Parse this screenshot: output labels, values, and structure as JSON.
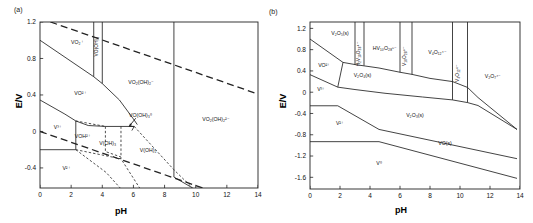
{
  "figure": {
    "panels": [
      {
        "tag": "(a)",
        "axes": {
          "xlabel": "pH",
          "ylabel": "E/V",
          "xticks": [
            "0",
            "2",
            "4",
            "6",
            "8",
            "10",
            "12",
            "14"
          ],
          "xtick_values": [
            0,
            2,
            4,
            6,
            8,
            10,
            12,
            14
          ],
          "yticks": [
            "1.2",
            "0.8",
            "0.4",
            "0",
            "-0.4"
          ],
          "ytick_values": [
            1.2,
            0.8,
            0.4,
            0,
            -0.4
          ],
          "xlim": [
            0,
            14
          ],
          "ylim": [
            -0.62,
            1.2
          ]
        },
        "species": [
          {
            "name": "VO2+",
            "label": "VO₂⁺",
            "x": 2.4,
            "y": 0.96,
            "rotate": 0
          },
          {
            "name": "VO-OH-3",
            "label": "VO(OH)₃",
            "x": 3.72,
            "y": 0.93,
            "rotate": -90
          },
          {
            "name": "VO2+-vanadyl",
            "label": "VO²⁺",
            "x": 2.6,
            "y": 0.4,
            "rotate": 0
          },
          {
            "name": "VO2-OH-2-minus",
            "label": "VO₂(OH)₂⁻",
            "x": 6.5,
            "y": 0.52,
            "rotate": 0
          },
          {
            "name": "VO-OH-3-neutral",
            "label": "VO(OH)₃⁰",
            "x": 6.45,
            "y": 0.155,
            "rotate": 0
          },
          {
            "name": "VO2-OH-2-2minus",
            "label": "VO₂(OH)₂²⁻",
            "x": 11.3,
            "y": 0.12,
            "rotate": 0
          },
          {
            "name": "V3+",
            "label": "V³⁺",
            "x": 1.15,
            "y": 0.025,
            "rotate": 0
          },
          {
            "name": "VOH2+",
            "label": "VOH²⁺",
            "x": 2.75,
            "y": -0.07,
            "rotate": 0
          },
          {
            "name": "V-OH-3",
            "label": "V(OH)₃",
            "x": 4.35,
            "y": -0.145,
            "rotate": 0
          },
          {
            "name": "V-OH-2",
            "label": "V(OH)₂",
            "x": 6.95,
            "y": -0.23,
            "rotate": 0
          },
          {
            "name": "V2+",
            "label": "V²⁺",
            "x": 1.7,
            "y": -0.42,
            "rotate": 0
          }
        ],
        "annotation": {
          "name": "arrow-to-vo-oh-3",
          "from_x": 6.15,
          "from_y": 0.145,
          "to_x": 5.72,
          "to_y": 0.055
        }
      },
      {
        "tag": "(b)",
        "axes": {
          "xlabel": "pH",
          "ylabel": "E/V",
          "xticks": [
            "0",
            "2",
            "4",
            "6",
            "8",
            "10",
            "12",
            "14"
          ],
          "xtick_values": [
            0,
            2,
            4,
            6,
            8,
            10,
            12,
            14
          ],
          "yticks": [
            "1.2",
            "0.8",
            "0.4",
            "0",
            "-0.4",
            "-0.8",
            "-1.2",
            "-1.6"
          ],
          "ytick_values": [
            1.2,
            0.8,
            0.4,
            0,
            -0.4,
            -0.8,
            -1.2,
            -1.6
          ],
          "xlim": [
            0,
            14
          ],
          "ylim": [
            -1.82,
            1.32
          ]
        },
        "species": [
          {
            "name": "V2O5-s",
            "label": "V₂O₅(s)",
            "x": 2.0,
            "y": 1.07,
            "rotate": 0
          },
          {
            "name": "H2V10O28-4minus",
            "label": "H₂V₁₀O₂₈⁴⁻",
            "x": 3.35,
            "y": 0.72,
            "rotate": -90
          },
          {
            "name": "HV10O28-5minus",
            "label": "HV₁₀O₂₈⁵⁻",
            "x": 5.0,
            "y": 0.8,
            "rotate": 0
          },
          {
            "name": "V10O28-6minus",
            "label": "V₁₀O₂₈⁶⁻",
            "x": 6.37,
            "y": 0.68,
            "rotate": -90
          },
          {
            "name": "V4O12-4minus",
            "label": "V₄O₁₂⁴⁻",
            "x": 8.5,
            "y": 0.72,
            "rotate": 0
          },
          {
            "name": "V4O12-4minus-vert",
            "label": "V₄O₁₂⁴⁻",
            "x": 9.95,
            "y": 0.36,
            "rotate": -90
          },
          {
            "name": "V2O7-4minus",
            "label": "V₂O₇⁴⁻",
            "x": 12.2,
            "y": 0.27,
            "rotate": 0
          },
          {
            "name": "VO2plus",
            "label": "VO²⁺",
            "x": 0.95,
            "y": 0.47,
            "rotate": 0
          },
          {
            "name": "V2O4-s",
            "label": "V₂O₄(s)",
            "x": 3.5,
            "y": 0.29,
            "rotate": 0
          },
          {
            "name": "V3plus",
            "label": "V³⁺",
            "x": 0.75,
            "y": 0.03,
            "rotate": 0
          },
          {
            "name": "V2plus",
            "label": "V²⁺",
            "x": 2.0,
            "y": -0.62,
            "rotate": 0
          },
          {
            "name": "V2O3-s",
            "label": "V₂O₃(s)",
            "x": 7.0,
            "y": -0.47,
            "rotate": 0
          },
          {
            "name": "VO-s",
            "label": "VO(s)",
            "x": 9.0,
            "y": -1.0,
            "rotate": 0
          },
          {
            "name": "V0",
            "label": "V⁰",
            "x": 4.6,
            "y": -1.36,
            "rotate": 0
          }
        ]
      }
    ]
  },
  "chart_data": [
    {
      "type": "line",
      "title": "(a) Pourbaix diagram of vanadium aqueous species",
      "xlabel": "pH",
      "ylabel": "E/V",
      "xlim": [
        0,
        14
      ],
      "ylim": [
        -0.62,
        1.2
      ],
      "grid": false,
      "legend": "none",
      "xticks": [
        0,
        2,
        4,
        6,
        8,
        10,
        12,
        14
      ],
      "yticks": [
        1.2,
        0.8,
        0.4,
        0,
        -0.4
      ],
      "solid_boundaries": [
        {
          "name": "VO2+/VO2+ boundary",
          "points": [
            [
              0,
              1.0
            ],
            [
              3.45,
              0.6
            ],
            [
              4.0,
              0.525
            ],
            [
              5.1,
              0.345
            ],
            [
              6.05,
              0.125
            ],
            [
              6.25,
              0.075
            ]
          ]
        },
        {
          "name": "V3+/VO2+ boundary",
          "points": [
            [
              0,
              0.345
            ],
            [
              1.6,
              0.19
            ],
            [
              2.3,
              0.115
            ],
            [
              3.1,
              0.065
            ],
            [
              4.2,
              0.055
            ],
            [
              5.2,
              0.055
            ],
            [
              6.05,
              0.055
            ]
          ]
        },
        {
          "name": "VO-OH-3 left vertical",
          "points": [
            [
              3.45,
              1.2
            ],
            [
              3.45,
              0.6
            ]
          ]
        },
        {
          "name": "VO-OH-3 right vertical",
          "points": [
            [
              4.0,
              1.2
            ],
            [
              4.0,
              0.525
            ]
          ]
        },
        {
          "name": "VO2-OH-2-2minus vertical",
          "points": [
            [
              8.6,
              1.2
            ],
            [
              8.6,
              -0.5
            ]
          ]
        },
        {
          "name": "VOH2+ vertical",
          "points": [
            [
              2.3,
              0.115
            ],
            [
              2.3,
              -0.2
            ]
          ]
        },
        {
          "name": "V2+ horizontal",
          "points": [
            [
              0,
              -0.2
            ],
            [
              2.3,
              -0.2
            ]
          ]
        },
        {
          "name": "VO-OH-3 apex triangle",
          "points": [
            [
              5.72,
              0.055
            ],
            [
              6.05,
              0.055
            ],
            [
              5.9,
              0.01
            ]
          ]
        },
        {
          "name": "lower convergence",
          "points": [
            [
              8.6,
              -0.5
            ],
            [
              9.8,
              -0.62
            ]
          ]
        }
      ],
      "dashed_boundaries": [
        {
          "name": "water oxidation line O2/H2O",
          "points": [
            [
              0,
              1.24
            ],
            [
              14,
              0.41
            ]
          ],
          "style": "long-dash"
        },
        {
          "name": "water reduction line H+/H2",
          "points": [
            [
              0,
              0.0
            ],
            [
              14,
              -0.83
            ]
          ],
          "style": "long-dash"
        },
        {
          "name": "V(OH)3 / V(OH)2 boundaries",
          "points": [
            [
              4.2,
              0.055
            ],
            [
              4.2,
              -0.22
            ],
            [
              5.2,
              -0.28
            ]
          ],
          "style": "short-dash"
        },
        {
          "name": "VOH2+/V(OH)3 boundary",
          "points": [
            [
              2.3,
              0.115
            ],
            [
              4.2,
              0.055
            ]
          ],
          "style": "short-dash"
        },
        {
          "name": "V(OH)3 region lower",
          "points": [
            [
              5.2,
              0.055
            ],
            [
              5.2,
              -0.3
            ]
          ],
          "style": "short-dash"
        },
        {
          "name": "VO(OH)3 descending",
          "points": [
            [
              6.05,
              0.055
            ],
            [
              8.6,
              -0.42
            ],
            [
              9.8,
              -0.62
            ]
          ],
          "style": "short-dash"
        },
        {
          "name": "V2+ boundary descending",
          "points": [
            [
              2.3,
              -0.2
            ],
            [
              5.2,
              -0.3
            ],
            [
              6.4,
              -0.62
            ]
          ],
          "style": "short-dash"
        },
        {
          "name": "V2+ inner boundary",
          "points": [
            [
              2.3,
              -0.2
            ],
            [
              4.25,
              -0.45
            ],
            [
              5.15,
              -0.62
            ]
          ],
          "style": "short-dash"
        }
      ],
      "regions": [
        "VO₂⁺",
        "VO(OH)₃",
        "VO²⁺",
        "VO₂(OH)₂⁻",
        "VO(OH)₃⁰",
        "VO₂(OH)₂²⁻",
        "V³⁺",
        "VOH²⁺",
        "V(OH)₃",
        "V(OH)₂",
        "V²⁺"
      ]
    },
    {
      "type": "line",
      "title": "(b) Pourbaix diagram of vanadium with polyoxovanadates",
      "xlabel": "pH",
      "ylabel": "E/V",
      "xlim": [
        0,
        14
      ],
      "ylim": [
        -1.82,
        1.32
      ],
      "grid": false,
      "legend": "none",
      "xticks": [
        0,
        2,
        4,
        6,
        8,
        10,
        12,
        14
      ],
      "yticks": [
        1.2,
        0.8,
        0.4,
        0,
        -0.4,
        -0.8,
        -1.2,
        -1.6
      ],
      "solid_boundaries": [
        {
          "name": "V2O5/VO2+ and V2O4 top boundary",
          "points": [
            [
              0,
              1.0
            ],
            [
              2.2,
              0.56
            ],
            [
              3.0,
              0.52
            ],
            [
              4.6,
              0.455
            ],
            [
              6.0,
              0.375
            ],
            [
              6.8,
              0.335
            ],
            [
              8.0,
              0.26
            ],
            [
              9.5,
              0.2
            ],
            [
              10.5,
              0.09
            ],
            [
              11.2,
              -0.1
            ],
            [
              13.8,
              -0.7
            ]
          ]
        },
        {
          "name": "VO2+/V3+ boundary",
          "points": [
            [
              0,
              0.33
            ],
            [
              1.85,
              0.095
            ]
          ]
        },
        {
          "name": "V2O4/V2O3 boundary",
          "points": [
            [
              1.85,
              0.095
            ],
            [
              3.0,
              0.05
            ],
            [
              5.0,
              -0.02
            ],
            [
              7.5,
              -0.09
            ],
            [
              9.5,
              -0.145
            ],
            [
              10.5,
              -0.195
            ],
            [
              11.2,
              -0.25
            ],
            [
              13.8,
              -0.7
            ]
          ]
        },
        {
          "name": "VO2+ lower vertical",
          "points": [
            [
              2.2,
              0.56
            ],
            [
              1.85,
              0.095
            ]
          ]
        },
        {
          "name": "V3+ / V2+ horizontal",
          "points": [
            [
              0,
              -0.255
            ],
            [
              1.85,
              -0.255
            ]
          ]
        },
        {
          "name": "V2+ / V2O3 boundary",
          "points": [
            [
              1.85,
              -0.255
            ],
            [
              4.6,
              -0.7
            ]
          ]
        },
        {
          "name": "V2O3/VO boundary",
          "points": [
            [
              4.6,
              -0.7
            ],
            [
              13.8,
              -1.25
            ]
          ]
        },
        {
          "name": "V2+ / V0 horizontal",
          "points": [
            [
              0,
              -0.93
            ],
            [
              4.6,
              -0.93
            ]
          ]
        },
        {
          "name": "VO / V0 boundary",
          "points": [
            [
              4.6,
              -0.93
            ],
            [
              13.8,
              -1.62
            ]
          ]
        },
        {
          "name": "H2V10O28 left vertical",
          "points": [
            [
              3.0,
              1.32
            ],
            [
              3.0,
              0.52
            ]
          ]
        },
        {
          "name": "H2V10O28 right vertical",
          "points": [
            [
              3.6,
              1.32
            ],
            [
              3.6,
              0.5
            ]
          ]
        },
        {
          "name": "V10O28 left vertical",
          "points": [
            [
              6.0,
              1.32
            ],
            [
              6.0,
              0.375
            ]
          ]
        },
        {
          "name": "V10O28 right vertical",
          "points": [
            [
              6.8,
              1.32
            ],
            [
              6.8,
              0.335
            ]
          ]
        },
        {
          "name": "V4O12 vertical left",
          "points": [
            [
              9.5,
              1.32
            ],
            [
              9.5,
              -0.145
            ]
          ]
        },
        {
          "name": "V4O12 vertical right",
          "points": [
            [
              10.5,
              1.32
            ],
            [
              10.5,
              -0.195
            ]
          ]
        }
      ],
      "regions": [
        "V₂O₅(s)",
        "H₂V₁₀O₂₈⁴⁻",
        "HV₁₀O₂₈⁵⁻",
        "V₁₀O₂₈⁶⁻",
        "V₄O₁₂⁴⁻",
        "V₂O₇⁴⁻",
        "VO²⁺",
        "V₂O₄(s)",
        "V³⁺",
        "V²⁺",
        "V₂O₃(s)",
        "VO(s)",
        "V⁰"
      ]
    }
  ]
}
